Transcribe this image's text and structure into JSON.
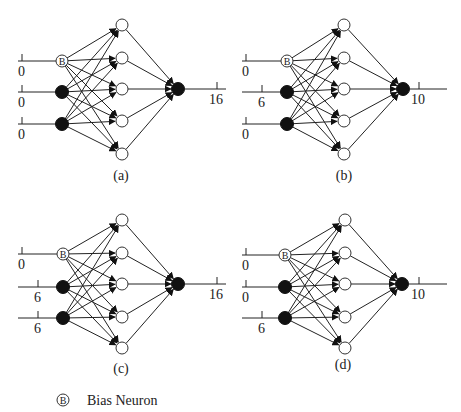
{
  "figure": {
    "legend": {
      "symbol": "B",
      "label": "Bias Neuron"
    },
    "panels": [
      {
        "id": "a",
        "caption": "(a)",
        "inputs": [
          {
            "role": "bias",
            "value": "0"
          },
          {
            "role": "input",
            "value": "0"
          },
          {
            "role": "input",
            "value": "0"
          }
        ],
        "output": {
          "value": "16"
        }
      },
      {
        "id": "b",
        "caption": "(b)",
        "inputs": [
          {
            "role": "bias",
            "value": "0"
          },
          {
            "role": "input",
            "value": "6"
          },
          {
            "role": "input",
            "value": "0"
          }
        ],
        "output": {
          "value": "10"
        }
      },
      {
        "id": "c",
        "caption": "(c)",
        "inputs": [
          {
            "role": "bias",
            "value": "0"
          },
          {
            "role": "input",
            "value": "6"
          },
          {
            "role": "input",
            "value": "6"
          }
        ],
        "output": {
          "value": "16"
        }
      },
      {
        "id": "d",
        "caption": "(d)",
        "inputs": [
          {
            "role": "bias",
            "value": "0"
          },
          {
            "role": "input",
            "value": "0"
          },
          {
            "role": "input",
            "value": "6"
          }
        ],
        "output": {
          "value": "10"
        }
      }
    ],
    "layers": {
      "input_count": 3,
      "hidden_count": 5,
      "output_count": 1
    }
  }
}
